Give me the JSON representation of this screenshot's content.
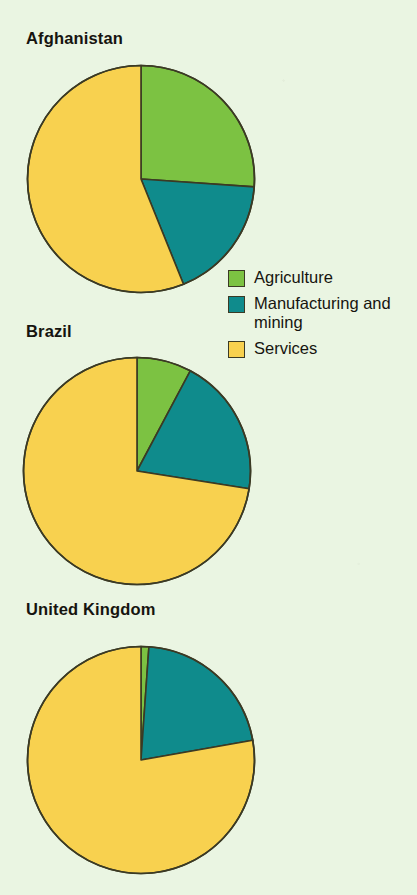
{
  "figure": {
    "background_color": "#eaf5e2",
    "outline_color": "#3b3a24"
  },
  "legend": {
    "position": "right-middle",
    "items": [
      {
        "label": "Agriculture",
        "color": "#7cc242",
        "swatch_name": "legend-swatch-agriculture"
      },
      {
        "label": "Manufacturing and mining",
        "color": "#0f8b8c",
        "swatch_name": "legend-swatch-manufacturing"
      },
      {
        "label": "Services",
        "color": "#f8d14f",
        "swatch_name": "legend-swatch-services"
      }
    ]
  },
  "charts": [
    {
      "title": "Afghanistan"
    },
    {
      "title": "Brazil"
    },
    {
      "title": "United Kingdom"
    }
  ],
  "chart_data": {
    "type": "pie",
    "title": "",
    "subtitle": "",
    "xlabel": "",
    "ylabel": "",
    "grid": false,
    "legend_position": "right",
    "start_angle_deg": 0,
    "direction": "clockwise",
    "categories": [
      "Agriculture",
      "Manufacturing and mining",
      "Services"
    ],
    "colors": [
      "#7cc242",
      "#0f8b8c",
      "#f8d14f"
    ],
    "charts": [
      {
        "title": "Afghanistan",
        "slices": [
          {
            "label": "Agriculture",
            "value": 26,
            "color": "#7cc242",
            "start_deg": 0,
            "end_deg": 94
          },
          {
            "label": "Manufacturing and mining",
            "value": 18,
            "color": "#0f8b8c",
            "start_deg": 94,
            "end_deg": 158
          },
          {
            "label": "Services",
            "value": 56,
            "color": "#f8d14f",
            "start_deg": 158,
            "end_deg": 360
          }
        ]
      },
      {
        "title": "Brazil",
        "slices": [
          {
            "label": "Agriculture",
            "value": 8,
            "color": "#7cc242",
            "start_deg": 0,
            "end_deg": 28
          },
          {
            "label": "Manufacturing and mining",
            "value": 20,
            "color": "#0f8b8c",
            "start_deg": 28,
            "end_deg": 99
          },
          {
            "label": "Services",
            "value": 72,
            "color": "#f8d14f",
            "start_deg": 99,
            "end_deg": 360
          }
        ]
      },
      {
        "title": "United Kingdom",
        "slices": [
          {
            "label": "Agriculture",
            "value": 1,
            "color": "#7cc242",
            "start_deg": 0,
            "end_deg": 4
          },
          {
            "label": "Manufacturing and mining",
            "value": 21,
            "color": "#0f8b8c",
            "start_deg": 4,
            "end_deg": 80
          },
          {
            "label": "Services",
            "value": 78,
            "color": "#f8d14f",
            "start_deg": 80,
            "end_deg": 360
          }
        ]
      }
    ]
  }
}
